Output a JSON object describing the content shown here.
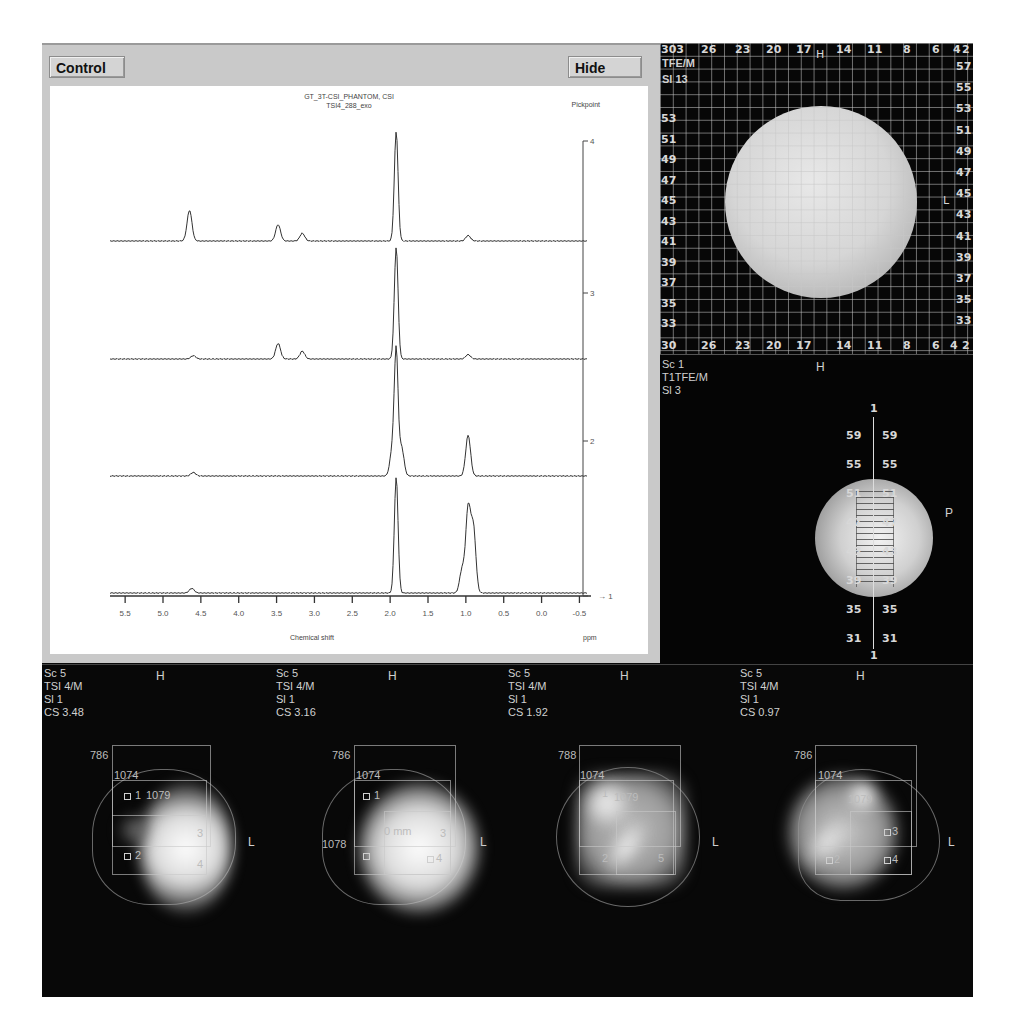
{
  "spectrum_panel": {
    "control_button": "Control",
    "hide_button": "Hide",
    "title_line1": "GT_3T-CSI_PHANTOM, CSI",
    "title_line2": "TSI4_288_exo",
    "pickpoint_label": "Pickpoint",
    "x_axis_label": "Chemical shift",
    "x_axis_unit": "ppm",
    "x_ticks": [
      "5.5",
      "5.0",
      "4.5",
      "4.0",
      "3.5",
      "3.0",
      "2.5",
      "2.0",
      "1.5",
      "1.0",
      "0.5",
      "0.0",
      "-0.5"
    ],
    "right_ticks": [
      "4",
      "3",
      "2",
      "1"
    ]
  },
  "chart_data": {
    "type": "line",
    "xlabel": "Chemical shift",
    "xunit": "ppm",
    "xlim": [
      5.7,
      -0.6
    ],
    "x_ticks": [
      5.5,
      5.0,
      4.5,
      4.0,
      3.5,
      3.0,
      2.5,
      2.0,
      1.5,
      1.0,
      0.5,
      0.0,
      -0.5
    ],
    "stacked_offsets": [
      "4",
      "3",
      "2",
      "1"
    ],
    "grid": false,
    "series": [
      {
        "name": "4",
        "peaks": [
          {
            "ppm": 4.65,
            "height": 0.28
          },
          {
            "ppm": 3.48,
            "height": 0.15
          },
          {
            "ppm": 3.16,
            "height": 0.07
          },
          {
            "ppm": 1.92,
            "height": 1.0
          },
          {
            "ppm": 0.97,
            "height": 0.05
          }
        ]
      },
      {
        "name": "3",
        "peaks": [
          {
            "ppm": 4.6,
            "height": 0.03
          },
          {
            "ppm": 3.48,
            "height": 0.14
          },
          {
            "ppm": 3.16,
            "height": 0.07
          },
          {
            "ppm": 1.92,
            "height": 1.0
          },
          {
            "ppm": 0.97,
            "height": 0.04
          }
        ]
      },
      {
        "name": "2",
        "peaks": [
          {
            "ppm": 4.6,
            "height": 0.03
          },
          {
            "ppm": 1.97,
            "height": 0.22
          },
          {
            "ppm": 1.92,
            "height": 1.0
          },
          {
            "ppm": 1.85,
            "height": 0.24
          },
          {
            "ppm": 0.97,
            "height": 0.34
          }
        ]
      },
      {
        "name": "1",
        "peaks": [
          {
            "ppm": 4.62,
            "height": 0.04
          },
          {
            "ppm": 1.92,
            "height": 1.0
          },
          {
            "ppm": 1.05,
            "height": 0.2
          },
          {
            "ppm": 0.97,
            "height": 0.72
          },
          {
            "ppm": 0.9,
            "height": 0.55
          }
        ]
      }
    ]
  },
  "grid_view": {
    "info_line1": "TFE/M",
    "info_line2": "Sl 13",
    "top_corner": "303",
    "top_labels": [
      "26",
      "23",
      "20",
      "17",
      "14",
      "11",
      "8",
      "6",
      "4",
      "2"
    ],
    "bottom_labels": [
      "30",
      "26",
      "23",
      "20",
      "17",
      "14",
      "11",
      "8",
      "6",
      "4",
      "2"
    ],
    "left_labels": [
      "53",
      "51",
      "49",
      "47",
      "45",
      "43",
      "41",
      "39",
      "37",
      "35",
      "33"
    ],
    "right_labels": [
      "57",
      "55",
      "53",
      "51",
      "49",
      "47",
      "45",
      "43",
      "41",
      "39",
      "37",
      "35",
      "33"
    ],
    "orient_top": "H",
    "orient_right": "L"
  },
  "sagittal_view": {
    "info": [
      "Sc 1",
      "T1TFE/M",
      "Sl 3"
    ],
    "orient_top": "H",
    "orient_right": "P",
    "ruler_top": "1",
    "ruler_bottom": "1",
    "ruler_labels": [
      "59",
      "55",
      "51",
      "47",
      "43",
      "39",
      "35",
      "31"
    ]
  },
  "csi_maps": [
    {
      "info": [
        "Sc 5",
        "TSI 4/M",
        "Sl 1",
        "CS 3.48"
      ],
      "orient_top": "H",
      "orient_right": "L",
      "labels": {
        "a": "786",
        "b": "1074",
        "c": "1079",
        "d": "",
        "v1": "1",
        "v2": "2",
        "v3": "3",
        "v4": "4"
      }
    },
    {
      "info": [
        "Sc 5",
        "TSI 4/M",
        "Sl 1",
        "CS 3.16"
      ],
      "orient_top": "H",
      "orient_right": "L",
      "labels": {
        "a": "786",
        "b": "1074",
        "c": "",
        "d": "1078",
        "v1": "1",
        "v2": "2",
        "v3": "3",
        "v4": "4",
        "mm": "0 mm"
      }
    },
    {
      "info": [
        "Sc 5",
        "TSI 4/M",
        "Sl 1",
        "CS 1.92"
      ],
      "orient_top": "H",
      "orient_right": "L",
      "labels": {
        "a": "788",
        "b": "1074",
        "c": "1079",
        "d": "",
        "v1": "1",
        "v2": "2",
        "v3": "",
        "v4": "5"
      }
    },
    {
      "info": [
        "Sc 5",
        "TSI 4/M",
        "Sl 1",
        "CS 0.97"
      ],
      "orient_top": "H",
      "orient_right": "L",
      "labels": {
        "a": "786",
        "b": "1074",
        "c": "1079",
        "d": "",
        "v1": "",
        "v2": "2",
        "v3": "3",
        "v4": "4"
      }
    }
  ]
}
